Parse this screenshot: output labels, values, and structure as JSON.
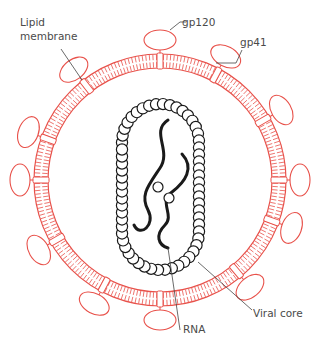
{
  "labels": {
    "lipid_membrane_line1": "Lipid",
    "lipid_membrane_line2": "membrane",
    "gp120": "gp120",
    "gp41": "gp41",
    "rna": "RNA",
    "viral_core": "Viral core"
  },
  "colors": {
    "membrane": "#e8514a",
    "core": "#1a1a1a",
    "leader": "#444444",
    "text": "#4a4a4a"
  },
  "geometry": {
    "center": [
      160,
      180
    ],
    "outer_radius": 126,
    "inner_radius": 112,
    "knob_angles_deg": [
      -90,
      -62,
      -30,
      0,
      20,
      50,
      90,
      118,
      150,
      180,
      200,
      232
    ],
    "core_bead_count": 60
  }
}
